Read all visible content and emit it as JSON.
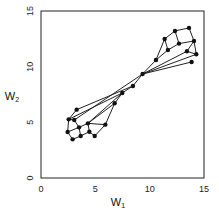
{
  "chart_data": {
    "type": "scatter",
    "subtype": "network-graph",
    "title": "",
    "xlabel": "W1",
    "ylabel": "W2",
    "xlim": [
      0,
      15
    ],
    "ylim": [
      0,
      15
    ],
    "xticks": [
      "0",
      "5",
      "10",
      "15"
    ],
    "yticks": [
      "0",
      "5",
      "10",
      "15"
    ],
    "grid": false,
    "legend": null,
    "nodes": [
      {
        "id": "a",
        "x": 3.28,
        "y": 6.14
      },
      {
        "id": "b",
        "x": 2.55,
        "y": 5.27
      },
      {
        "id": "c",
        "x": 3.06,
        "y": 5.21
      },
      {
        "id": "d",
        "x": 3.5,
        "y": 4.55
      },
      {
        "id": "e",
        "x": 4.32,
        "y": 4.91
      },
      {
        "id": "f",
        "x": 2.45,
        "y": 4.13
      },
      {
        "id": "g",
        "x": 4.45,
        "y": 4.16
      },
      {
        "id": "h",
        "x": 3.65,
        "y": 3.77
      },
      {
        "id": "i",
        "x": 2.91,
        "y": 3.47
      },
      {
        "id": "j",
        "x": 4.94,
        "y": 3.77
      },
      {
        "id": "k",
        "x": 5.92,
        "y": 4.79
      },
      {
        "id": "l",
        "x": 6.78,
        "y": 6.71
      },
      {
        "id": "m",
        "x": 7.48,
        "y": 7.64
      },
      {
        "id": "n",
        "x": 8.46,
        "y": 8.27
      },
      {
        "id": "o",
        "x": 9.35,
        "y": 9.34
      },
      {
        "id": "p",
        "x": 10.58,
        "y": 10.6
      },
      {
        "id": "q",
        "x": 11.38,
        "y": 12.49
      },
      {
        "id": "r",
        "x": 11.68,
        "y": 11.5
      },
      {
        "id": "s",
        "x": 12.33,
        "y": 13.21
      },
      {
        "id": "t",
        "x": 12.7,
        "y": 12.07
      },
      {
        "id": "u",
        "x": 13.62,
        "y": 13.48
      },
      {
        "id": "v",
        "x": 14.08,
        "y": 12.31
      },
      {
        "id": "w",
        "x": 13.43,
        "y": 11.38
      },
      {
        "id": "x",
        "x": 14.29,
        "y": 11.11
      },
      {
        "id": "y",
        "x": 13.86,
        "y": 10.42
      }
    ],
    "edges": [
      [
        "a",
        "b"
      ],
      [
        "b",
        "c"
      ],
      [
        "b",
        "f"
      ],
      [
        "c",
        "d"
      ],
      [
        "d",
        "f"
      ],
      [
        "f",
        "i"
      ],
      [
        "i",
        "h"
      ],
      [
        "d",
        "h"
      ],
      [
        "h",
        "g"
      ],
      [
        "g",
        "e"
      ],
      [
        "d",
        "e"
      ],
      [
        "g",
        "j"
      ],
      [
        "e",
        "k"
      ],
      [
        "k",
        "j"
      ],
      [
        "k",
        "l"
      ],
      [
        "e",
        "l"
      ],
      [
        "a",
        "n"
      ],
      [
        "c",
        "o"
      ],
      [
        "b",
        "m"
      ],
      [
        "l",
        "m"
      ],
      [
        "m",
        "n"
      ],
      [
        "n",
        "o"
      ],
      [
        "o",
        "p"
      ],
      [
        "e",
        "m"
      ],
      [
        "p",
        "r"
      ],
      [
        "r",
        "q"
      ],
      [
        "q",
        "s"
      ],
      [
        "s",
        "u"
      ],
      [
        "s",
        "t"
      ],
      [
        "u",
        "v"
      ],
      [
        "t",
        "v"
      ],
      [
        "r",
        "t"
      ],
      [
        "v",
        "w"
      ],
      [
        "v",
        "x"
      ],
      [
        "w",
        "x"
      ],
      [
        "o",
        "w"
      ],
      [
        "o",
        "y"
      ],
      [
        "p",
        "q"
      ],
      [
        "o",
        "x"
      ]
    ]
  }
}
